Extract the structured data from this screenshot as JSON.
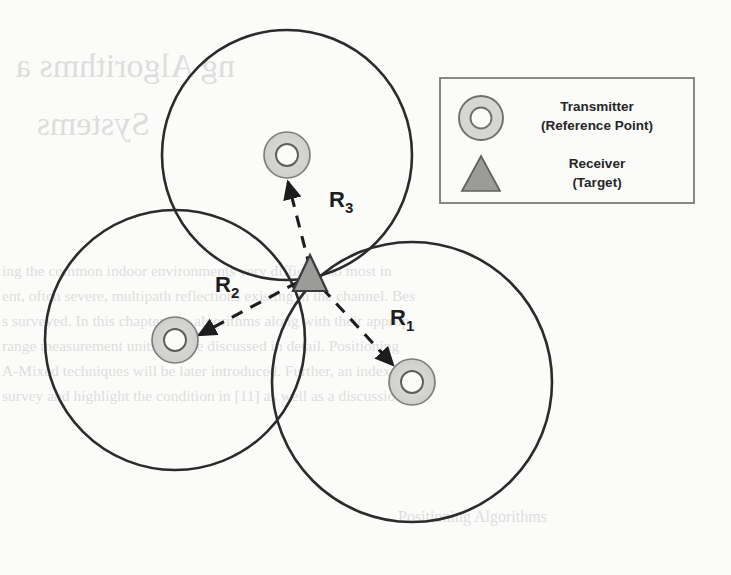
{
  "page": {
    "background_color": "#fbfbfa",
    "ink_color": "#2b2b2b",
    "fill_gray": "#c9c9c7",
    "width": 731,
    "height": 575
  },
  "ghost_text": {
    "note": "Faint show-through text from the reverse of the scanned page",
    "heading_mirrored_1": "ng Algorithms a",
    "heading_mirrored_2": "Systems",
    "body_lines": [
      "ing the common indoor environments very difficult, so most in",
      "ent, often severe, multipath reflections existing in the channel. Bes",
      "s surveyed. In this chapter, the algorithms along with their approp",
      "range measurement units will be discussed in detail. Positioning",
      "A-Mixed techniques will be later introduced. Further, an index com",
      "survey and highlight the condition in [11] as well as a discussion",
      "Positioning Algorithms"
    ]
  },
  "diagram": {
    "circles": [
      {
        "id": "circle-top",
        "label": "Transmitter 3 coverage",
        "cx": 287,
        "cy": 155,
        "r": 125
      },
      {
        "id": "circle-left",
        "label": "Transmitter 2 coverage",
        "cx": 175,
        "cy": 340,
        "r": 130
      },
      {
        "id": "circle-right",
        "label": "Transmitter 1 coverage",
        "cx": 412,
        "cy": 382,
        "r": 140
      }
    ],
    "transmitters": [
      {
        "id": "transmitter-3",
        "cx": 287,
        "cy": 155,
        "outer_r": 23,
        "inner_r": 11
      },
      {
        "id": "transmitter-2",
        "cx": 175,
        "cy": 340,
        "outer_r": 23,
        "inner_r": 11
      },
      {
        "id": "transmitter-1",
        "cx": 412,
        "cy": 382,
        "outer_r": 23,
        "inner_r": 11
      }
    ],
    "receiver": {
      "id": "receiver-target",
      "cx": 310,
      "cy": 278,
      "half_width": 17,
      "height": 34
    },
    "ranges": [
      {
        "id": "range-1",
        "label": "R",
        "subscript": "1",
        "label_x": 390,
        "label_y": 325,
        "from": "receiver",
        "to": "transmitter-1"
      },
      {
        "id": "range-2",
        "label": "R",
        "subscript": "2",
        "label_x": 215,
        "label_y": 292,
        "from": "receiver",
        "to": "transmitter-2"
      },
      {
        "id": "range-3",
        "label": "R",
        "subscript": "3",
        "label_x": 329,
        "label_y": 207,
        "from": "receiver",
        "to": "transmitter-3"
      }
    ]
  },
  "legend": {
    "box": {
      "x": 440,
      "y": 78,
      "width": 254,
      "height": 125
    },
    "entries": [
      {
        "id": "legend-transmitter",
        "icon": "ring-icon",
        "line1": "Transmitter",
        "line2": "(Reference Point)"
      },
      {
        "id": "legend-receiver",
        "icon": "triangle-icon",
        "line1": "Receiver",
        "line2": "(Target)"
      }
    ]
  }
}
